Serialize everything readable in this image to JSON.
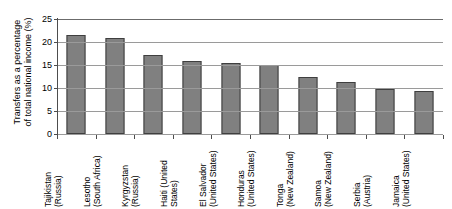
{
  "chart_data": {
    "type": "bar",
    "title": "",
    "xlabel": "",
    "ylabel": "Transfers as a percentage of total national income (%)",
    "ylabel_lines": [
      "Transfers as a percentage",
      "of total national income (%)"
    ],
    "ylim": [
      0,
      25
    ],
    "ytick_values": [
      0,
      5,
      10,
      15,
      20,
      25
    ],
    "ytick_labels": [
      "0",
      "5",
      "10",
      "15",
      "20",
      "25"
    ],
    "grid": true,
    "grid_axis": "y",
    "legend": false,
    "legend_position": "none",
    "bar_color": "#808080",
    "bar_edge_color": "#3f3f3f",
    "categories": [
      "Tajikistan (Russia)",
      "Lesotho (South Africa)",
      "Kyrgyzstan (Russia)",
      "Haiti (United States)",
      "El Salvador (United States)",
      "Honduras (United States)",
      "Tonga (New Zealand)",
      "Samoa (New Zealand)",
      "Serbia (Austria)",
      "Jamaica (United States)"
    ],
    "category_lines": [
      [
        "Tajikistan",
        "(Russia)"
      ],
      [
        "Lesotho",
        "(South Africa)"
      ],
      [
        "Kyrgyzstan",
        "(Russia)"
      ],
      [
        "Haiti (United",
        "States)"
      ],
      [
        "El Salvador",
        "(United States)"
      ],
      [
        "Honduras",
        "(United States)"
      ],
      [
        "Tonga",
        "(New Zealand)"
      ],
      [
        "Samoa",
        "(New Zealand)"
      ],
      [
        "Serbia",
        "(Austria)"
      ],
      [
        "Jamaica",
        "(United States)"
      ]
    ],
    "values": [
      21.6,
      20.9,
      17.1,
      15.8,
      15.5,
      15.1,
      12.5,
      11.4,
      9.8,
      9.4
    ]
  }
}
